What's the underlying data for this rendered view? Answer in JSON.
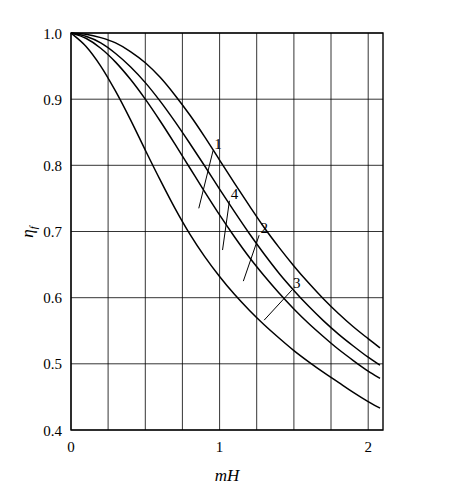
{
  "chart_data": {
    "type": "line",
    "title": "",
    "xlabel": "mH",
    "ylabel": "ηf",
    "ylabel_main": "η",
    "ylabel_sub": "f",
    "xlim": [
      0,
      2.1
    ],
    "ylim": [
      0.4,
      1.0
    ],
    "xticks": [
      0,
      1,
      2
    ],
    "xtick_labels": [
      "0",
      "1",
      "2"
    ],
    "x_gridlines": [
      0,
      0.25,
      0.5,
      0.75,
      1.0,
      1.25,
      1.5,
      1.75,
      2.0
    ],
    "yticks": [
      0.4,
      0.5,
      0.6,
      0.7,
      0.8,
      0.9,
      1.0
    ],
    "ytick_labels": [
      "0.4",
      "0.5",
      "0.6",
      "0.7",
      "0.8",
      "0.9",
      "1.0"
    ],
    "grid": true,
    "legend": "inline-labels",
    "annotations": [
      {
        "label": "1",
        "x": 0.99,
        "y": 0.833,
        "leader_to_x": 0.86,
        "leader_to_y": 0.735
      },
      {
        "label": "4",
        "x": 1.1,
        "y": 0.757,
        "leader_to_x": 1.02,
        "leader_to_y": 0.672
      },
      {
        "label": "2",
        "x": 1.3,
        "y": 0.705,
        "leader_to_x": 1.16,
        "leader_to_y": 0.625
      },
      {
        "label": "3",
        "x": 1.52,
        "y": 0.622,
        "leader_to_x": 1.3,
        "leader_to_y": 0.566
      }
    ],
    "series": [
      {
        "name": "1",
        "x": [
          0,
          0.1,
          0.2,
          0.3,
          0.4,
          0.5,
          0.6,
          0.7,
          0.8,
          0.9,
          1.0,
          1.1,
          1.2,
          1.3,
          1.4,
          1.5,
          1.6,
          1.7,
          1.8,
          1.9,
          2.0,
          2.08
        ],
        "values": [
          1.0,
          0.998,
          0.993,
          0.985,
          0.972,
          0.955,
          0.933,
          0.906,
          0.876,
          0.843,
          0.808,
          0.773,
          0.739,
          0.706,
          0.676,
          0.648,
          0.622,
          0.598,
          0.576,
          0.556,
          0.538,
          0.524
        ]
      },
      {
        "name": "4",
        "x": [
          0,
          0.1,
          0.2,
          0.3,
          0.4,
          0.5,
          0.6,
          0.7,
          0.8,
          0.9,
          1.0,
          1.1,
          1.2,
          1.3,
          1.4,
          1.5,
          1.6,
          1.7,
          1.8,
          1.9,
          2.0,
          2.08
        ],
        "values": [
          1.0,
          0.995,
          0.985,
          0.969,
          0.949,
          0.925,
          0.897,
          0.866,
          0.833,
          0.799,
          0.764,
          0.73,
          0.697,
          0.666,
          0.637,
          0.611,
          0.587,
          0.565,
          0.545,
          0.527,
          0.51,
          0.498
        ]
      },
      {
        "name": "2",
        "x": [
          0,
          0.1,
          0.2,
          0.3,
          0.4,
          0.5,
          0.6,
          0.7,
          0.8,
          0.9,
          1.0,
          1.1,
          1.2,
          1.3,
          1.4,
          1.5,
          1.6,
          1.7,
          1.8,
          1.9,
          2.0,
          2.08
        ],
        "values": [
          1.0,
          0.992,
          0.977,
          0.956,
          0.93,
          0.9,
          0.867,
          0.832,
          0.796,
          0.76,
          0.725,
          0.692,
          0.661,
          0.633,
          0.607,
          0.583,
          0.561,
          0.541,
          0.522,
          0.505,
          0.489,
          0.478
        ]
      },
      {
        "name": "3",
        "x": [
          0,
          0.1,
          0.2,
          0.3,
          0.4,
          0.5,
          0.6,
          0.7,
          0.8,
          0.9,
          1.0,
          1.1,
          1.2,
          1.3,
          1.4,
          1.5,
          1.6,
          1.7,
          1.8,
          1.9,
          2.0,
          2.08
        ],
        "values": [
          1.0,
          0.98,
          0.95,
          0.912,
          0.869,
          0.823,
          0.778,
          0.735,
          0.696,
          0.662,
          0.632,
          0.605,
          0.581,
          0.559,
          0.539,
          0.52,
          0.503,
          0.487,
          0.472,
          0.457,
          0.443,
          0.433
        ]
      }
    ]
  }
}
